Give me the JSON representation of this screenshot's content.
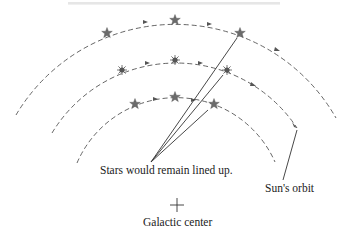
{
  "diagram": {
    "labels": {
      "stars_lined_up": "Stars would remain lined up.",
      "sun_orbit": "Sun's orbit",
      "galactic_center": "Galactic center"
    },
    "galactic_center_marker": {
      "x": 177,
      "y": 205,
      "symbol": "plus"
    },
    "orbits": [
      {
        "name": "outer",
        "radius": 185,
        "stars": [
          {
            "x": 107,
            "y": 33
          },
          {
            "x": 175,
            "y": 20
          },
          {
            "x": 240,
            "y": 33
          }
        ],
        "star_type": "five-point-star"
      },
      {
        "name": "middle",
        "radius": 145,
        "stars": [
          {
            "x": 122,
            "y": 70
          },
          {
            "x": 175,
            "y": 60
          },
          {
            "x": 227,
            "y": 70
          }
        ],
        "star_type": "sunburst"
      },
      {
        "name": "inner",
        "radius": 108,
        "stars": [
          {
            "x": 135,
            "y": 104
          },
          {
            "x": 175,
            "y": 97
          },
          {
            "x": 214,
            "y": 104
          }
        ],
        "star_type": "five-point-star"
      }
    ],
    "sightlines_origin": {
      "x": 151,
      "y": 162
    },
    "colors": {
      "line": "#333333",
      "star": "#6b6b6b",
      "arc": "#555555"
    }
  }
}
